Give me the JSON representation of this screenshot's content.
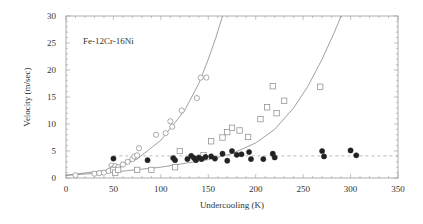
{
  "chart_data": {
    "type": "scatter",
    "title": "",
    "annotation": "Fe-12Cr-16Ni",
    "xlabel": "Undercooling (K)",
    "ylabel": "Velocity (m/sec)",
    "xlim": [
      0,
      350
    ],
    "ylim": [
      0,
      30
    ],
    "xticks": [
      0,
      50,
      100,
      150,
      200,
      250,
      300,
      350
    ],
    "yticks": [
      0,
      5,
      10,
      15,
      20,
      25,
      30
    ],
    "grid": false,
    "legend": null,
    "series": [
      {
        "name": "open circles",
        "marker": "circle-open",
        "points": [
          [
            10,
            0.5
          ],
          [
            30,
            0.8
          ],
          [
            35,
            0.9
          ],
          [
            40,
            1.0
          ],
          [
            45,
            1.3
          ],
          [
            48,
            2.3
          ],
          [
            50,
            1.8
          ],
          [
            52,
            2.2
          ],
          [
            55,
            2.0
          ],
          [
            60,
            2.5
          ],
          [
            65,
            3.0
          ],
          [
            70,
            3.5
          ],
          [
            72,
            4.0
          ],
          [
            75,
            4.2
          ],
          [
            77,
            5.5
          ],
          [
            95,
            8.0
          ],
          [
            105,
            8.3
          ],
          [
            110,
            10.5
          ],
          [
            112,
            9.5
          ],
          [
            122,
            12.5
          ],
          [
            138,
            14.8
          ],
          [
            142,
            18.6
          ],
          [
            148,
            18.6
          ]
        ]
      },
      {
        "name": "open squares",
        "marker": "square-open",
        "points": [
          [
            50,
            1.5
          ],
          [
            52,
            1.0
          ],
          [
            55,
            1.5
          ],
          [
            75,
            1.5
          ],
          [
            90,
            1.5
          ],
          [
            115,
            2.0
          ],
          [
            120,
            5.0
          ],
          [
            145,
            4.2
          ],
          [
            153,
            6.8
          ],
          [
            165,
            7.5
          ],
          [
            170,
            8.5
          ],
          [
            175,
            9.3
          ],
          [
            183,
            8.8
          ],
          [
            192,
            7.6
          ],
          [
            205,
            10.9
          ],
          [
            212,
            13.1
          ],
          [
            222,
            12.0
          ],
          [
            230,
            14.3
          ],
          [
            268,
            16.9
          ],
          [
            218,
            17.0
          ]
        ]
      },
      {
        "name": "filled circles",
        "marker": "circle-filled",
        "points": [
          [
            50,
            3.6
          ],
          [
            86,
            3.3
          ],
          [
            113,
            3.7
          ],
          [
            115,
            3.3
          ],
          [
            128,
            3.5
          ],
          [
            132,
            4.1
          ],
          [
            135,
            3.7
          ],
          [
            137,
            3.3
          ],
          [
            140,
            3.8
          ],
          [
            143,
            3.5
          ],
          [
            147,
            3.9
          ],
          [
            153,
            4.0
          ],
          [
            157,
            3.6
          ],
          [
            165,
            4.5
          ],
          [
            170,
            3.2
          ],
          [
            175,
            5.0
          ],
          [
            180,
            4.3
          ],
          [
            185,
            4.4
          ],
          [
            193,
            4.8
          ],
          [
            195,
            3.5
          ],
          [
            208,
            3.5
          ],
          [
            218,
            4.5
          ],
          [
            220,
            3.8
          ],
          [
            270,
            5.0
          ],
          [
            272,
            4.0
          ],
          [
            300,
            5.1
          ],
          [
            306,
            4.2
          ]
        ]
      }
    ],
    "curves": [
      {
        "name": "fit curve 1 (steep)",
        "style": "solid",
        "points": [
          [
            0,
            0.5
          ],
          [
            50,
            1.6
          ],
          [
            75,
            3.5
          ],
          [
            100,
            7.0
          ],
          [
            125,
            12.5
          ],
          [
            140,
            17.5
          ],
          [
            150,
            22.0
          ],
          [
            158,
            26.0
          ],
          [
            165,
            30.0
          ]
        ]
      },
      {
        "name": "fit curve 2",
        "style": "solid",
        "points": [
          [
            0,
            0.5
          ],
          [
            50,
            1.1
          ],
          [
            100,
            2.0
          ],
          [
            150,
            3.4
          ],
          [
            175,
            4.5
          ],
          [
            200,
            6.5
          ],
          [
            220,
            9.0
          ],
          [
            240,
            13.0
          ],
          [
            255,
            17.0
          ],
          [
            270,
            22.0
          ],
          [
            283,
            27.0
          ],
          [
            290,
            30.0
          ]
        ]
      },
      {
        "name": "plateau",
        "style": "dashed",
        "points": [
          [
            50,
            4.1
          ],
          [
            350,
            4.1
          ]
        ]
      }
    ]
  }
}
